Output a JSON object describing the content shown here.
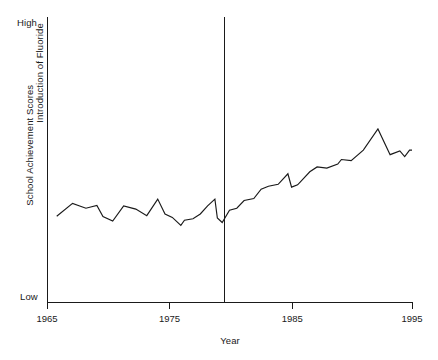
{
  "chart_data": {
    "type": "line",
    "title": "",
    "xlabel": "Year",
    "ylabel": "School Achievement Scores",
    "xlim": [
      1965,
      1995
    ],
    "ylim": [
      0,
      100
    ],
    "grid": false,
    "legend": null,
    "y_tick_labels": [
      "Low",
      "High"
    ],
    "x_tick_labels": [
      "1965",
      "1975",
      "1985",
      "1995"
    ],
    "x_ticks": [
      1965,
      1975,
      1985,
      1995
    ],
    "annotations": [
      {
        "name": "introduction-of-fluoride",
        "text": "Introduction of Fluoride",
        "x": 1979.5,
        "orientation": "vertical-line"
      }
    ],
    "series": [
      {
        "name": "School Achievement Scores",
        "color": "#1a1a1a",
        "x": [
          1965.8,
          1967.1,
          1968.2,
          1969.1,
          1969.6,
          1970.4,
          1971.3,
          1972.3,
          1973.2,
          1974.1,
          1974.7,
          1975.3,
          1976.0,
          1976.3,
          1977.0,
          1977.6,
          1978.2,
          1978.8,
          1979.0,
          1979.4,
          1980.0,
          1980.6,
          1981.2,
          1982.0,
          1982.6,
          1983.2,
          1984.0,
          1984.8,
          1985.1,
          1985.6,
          1986.6,
          1987.2,
          1988.0,
          1988.9,
          1989.2,
          1990.0,
          1991.0,
          1992.2,
          1993.2,
          1994.0,
          1994.4,
          1994.8,
          1995.0
        ],
        "y": [
          30.1,
          34.6,
          32.9,
          33.9,
          30.0,
          28.4,
          33.7,
          32.6,
          30.3,
          36.1,
          30.9,
          29.7,
          26.9,
          28.7,
          29.2,
          30.9,
          33.7,
          36.1,
          29.5,
          27.9,
          32.2,
          32.9,
          35.6,
          36.3,
          39.6,
          40.6,
          41.3,
          45.0,
          40.3,
          41.1,
          45.7,
          47.4,
          47.0,
          48.4,
          50.0,
          49.6,
          53.3,
          60.7,
          51.7,
          53.0,
          51.0,
          53.3,
          53.3
        ]
      }
    ]
  },
  "labels": {
    "y_high": "High",
    "y_low": "Low",
    "y_title": "School Achievement Scores",
    "x_title": "Year",
    "event": "Introduction of Fluoride",
    "x_tick_1": "1965",
    "x_tick_2": "1975",
    "x_tick_3": "1985",
    "x_tick_4": "1995"
  },
  "colors": {
    "line": "#1a1a1a",
    "axis": "#1a1a1a",
    "background": "#ffffff"
  }
}
